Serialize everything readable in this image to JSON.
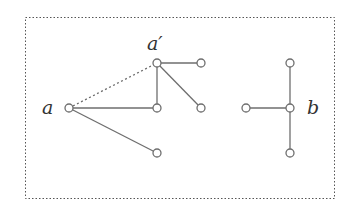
{
  "diagram": {
    "frame": {
      "x": 25,
      "y": 17,
      "width": 309,
      "height": 181,
      "style": "dotted",
      "color": "#555555"
    },
    "colors": {
      "edge": "#6e6e6e",
      "node_stroke": "#6e6e6e",
      "node_fill": "#ffffff",
      "label": "#333333"
    },
    "node_radius": 4,
    "labels": [
      {
        "id": "label-a",
        "text": "a",
        "x": 42,
        "y": 114
      },
      {
        "id": "label-a-prime",
        "text": "a′",
        "x": 147,
        "y": 50
      },
      {
        "id": "label-b",
        "text": "b",
        "x": 307,
        "y": 114
      }
    ],
    "nodes": [
      {
        "id": "a",
        "x": 69,
        "y": 108
      },
      {
        "id": "a-prime",
        "x": 157,
        "y": 63
      },
      {
        "id": "n1",
        "x": 201,
        "y": 63
      },
      {
        "id": "n2",
        "x": 157,
        "y": 108
      },
      {
        "id": "n3",
        "x": 201,
        "y": 108
      },
      {
        "id": "n4",
        "x": 157,
        "y": 153
      },
      {
        "id": "b",
        "x": 290,
        "y": 108
      },
      {
        "id": "b-top",
        "x": 290,
        "y": 63
      },
      {
        "id": "b-left",
        "x": 246,
        "y": 108
      },
      {
        "id": "b-bottom",
        "x": 290,
        "y": 153
      }
    ],
    "edges": [
      {
        "from": "a",
        "to": "a-prime",
        "style": "dotted"
      },
      {
        "from": "a",
        "to": "n2",
        "style": "solid"
      },
      {
        "from": "a",
        "to": "n4",
        "style": "solid"
      },
      {
        "from": "a-prime",
        "to": "n1",
        "style": "solid"
      },
      {
        "from": "a-prime",
        "to": "n2",
        "style": "solid"
      },
      {
        "from": "a-prime",
        "to": "n3",
        "style": "solid"
      },
      {
        "from": "b",
        "to": "b-top",
        "style": "solid"
      },
      {
        "from": "b",
        "to": "b-left",
        "style": "solid"
      },
      {
        "from": "b",
        "to": "b-bottom",
        "style": "solid"
      }
    ]
  }
}
